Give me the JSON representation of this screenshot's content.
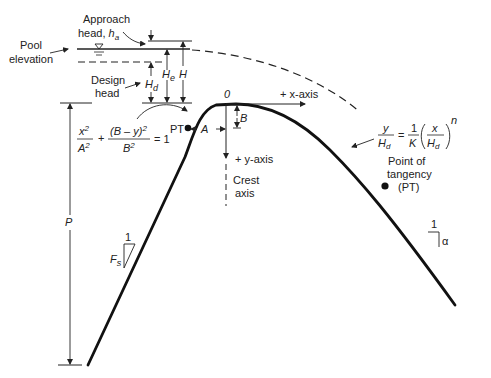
{
  "diagram": {
    "type": "ogee spillway crest profile",
    "labels": {
      "approach_head_line1": "Approach",
      "approach_head_line2": "head, ",
      "approach_head_symbol": "h",
      "approach_head_sub": "a",
      "pool_line1": "Pool",
      "pool_line2": "elevation",
      "design_head_line1": "Design",
      "design_head_line2": "head",
      "He": "H",
      "He_sub": "e",
      "H": "H",
      "Hd": "H",
      "Hd_sub": "d",
      "origin": "0",
      "x_axis": "+ x-axis",
      "y_axis": "+ y-axis",
      "B": "B",
      "A": "A",
      "PT_left": "PT",
      "crest_axis_line1": "Crest",
      "crest_axis_line2": "axis",
      "P": "P",
      "Fs": "F",
      "Fs_sub": "s",
      "slope_one_left": "1",
      "slope_one_right": "1",
      "alpha": "α",
      "pt_line1": "Point of",
      "pt_line2": "tangency",
      "pt_line3": "(PT)"
    },
    "equations": {
      "ellipse": {
        "num1": "x",
        "num1_sup": "2",
        "den1": "A",
        "den1_sup": "2",
        "plus": "+",
        "num2": "(B – y)",
        "num2_sup": "2",
        "den2": "B",
        "den2_sup": "2",
        "rhs": "= 1"
      },
      "power_law": {
        "lhs_num": "y",
        "lhs_den": "H",
        "lhs_den_sub": "d",
        "eq": "=",
        "k_num": "1",
        "k_den": "K",
        "x_num": "x",
        "x_den": "H",
        "x_den_sub": "d",
        "exp": "n"
      }
    }
  }
}
